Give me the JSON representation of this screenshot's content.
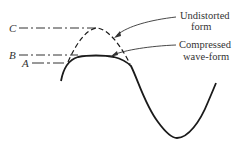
{
  "diagram": {
    "type": "waveform-distortion",
    "level_labels": {
      "c": "C",
      "b": "B",
      "a": "A"
    },
    "annotations": {
      "undistorted_line1": "Undistorted",
      "undistorted_line2": "form",
      "compressed_line1": "Compressed",
      "compressed_line2": "wave-form"
    },
    "colors": {
      "stroke": "#1a1a1a",
      "text": "#333333",
      "background": "#ffffff"
    }
  }
}
